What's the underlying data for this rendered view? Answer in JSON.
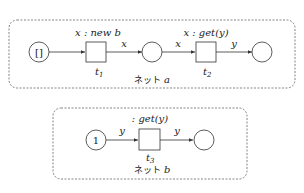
{
  "net_a": {
    "label_prefix": "ネット",
    "label_var": "a",
    "token_start": "[]",
    "t1": {
      "name": "t",
      "sub": "1",
      "guard": "x : new b"
    },
    "t2": {
      "name": "t",
      "sub": "2",
      "guard": "x : get(y)"
    },
    "arcs": {
      "p1_t1": "",
      "t1_p2": "x",
      "p2_t2": "x",
      "t2_p3": "y"
    }
  },
  "net_b": {
    "label_prefix": "ネット",
    "label_var": "b",
    "token_start": "1",
    "t3": {
      "name": "t",
      "sub": "3",
      "guard": ": get(y)"
    },
    "arcs": {
      "p1_t3": "y",
      "t3_p2": "y"
    }
  }
}
